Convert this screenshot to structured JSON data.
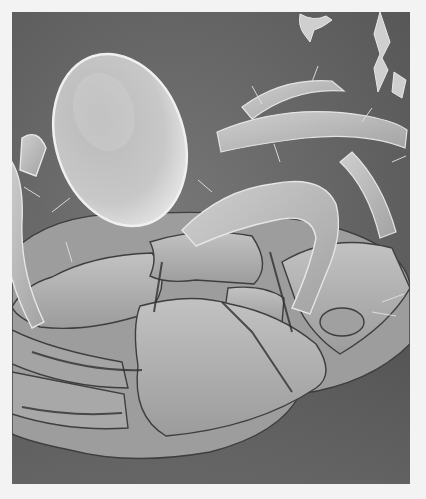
{
  "image": {
    "subject": "scanning electron micrograph of a mite (ventral view) beside an oval egg",
    "style": "grayscale",
    "colors": {
      "page_background": "#f3f3f3",
      "micrograph_background": "#6e6e6e",
      "specimen_highlight": "#d6d6d6",
      "specimen_midtone": "#a8a8a8",
      "crevice_shadow": "#3a3a3a"
    },
    "elements": [
      {
        "name": "egg",
        "shape": "oval",
        "position": "upper-left center"
      },
      {
        "name": "mite-body",
        "position": "lower half"
      },
      {
        "name": "legs",
        "count_visible": "several",
        "position": "left and right edges"
      },
      {
        "name": "debris",
        "position": "top-right corner"
      }
    ]
  }
}
